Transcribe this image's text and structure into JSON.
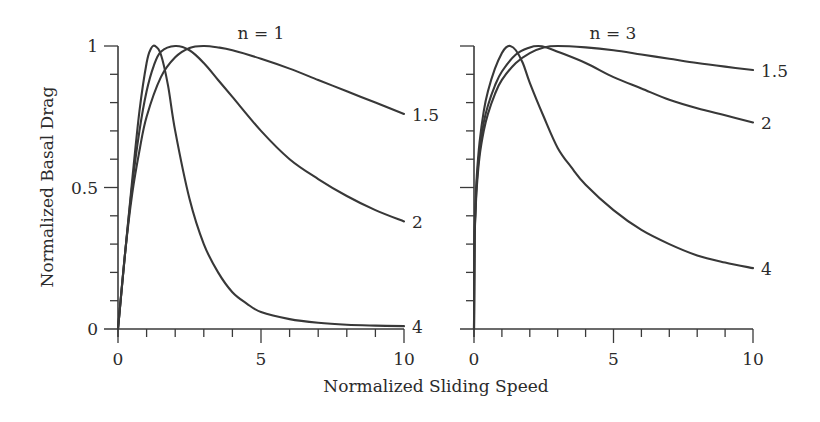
{
  "chart_data": {
    "type": "line",
    "xlabel": "Normalized Sliding Speed",
    "ylabel": "Normalized Basal Drag",
    "panels": [
      {
        "title": "n = 1",
        "xlim": [
          0,
          10
        ],
        "ylim": [
          0,
          1
        ],
        "x_tick_labels": [
          "0",
          "5",
          "10"
        ],
        "x_major_ticks": [
          0,
          5,
          10
        ],
        "x_minor_ticks": [
          1,
          2,
          3,
          4,
          6,
          7,
          8,
          9
        ],
        "y_tick_labels": [
          "0",
          "0.5",
          "1"
        ],
        "y_major_ticks": [
          0,
          0.5,
          1
        ],
        "y_minor_ticks": [
          0.1,
          0.2,
          0.3,
          0.4,
          0.6,
          0.7,
          0.8,
          0.9
        ],
        "show_y_tick_labels": true,
        "series": [
          {
            "name": "1.5",
            "x": [
              0,
              0.25,
              0.5,
              0.75,
              1,
              1.5,
              2,
              2.5,
              3,
              3.5,
              4,
              5,
              6,
              7,
              8,
              9,
              10
            ],
            "y": [
              0,
              0.27,
              0.48,
              0.63,
              0.75,
              0.89,
              0.96,
              0.993,
              1.0,
              0.995,
              0.985,
              0.955,
              0.92,
              0.88,
              0.84,
              0.8,
              0.76
            ]
          },
          {
            "name": "2",
            "x": [
              0,
              0.25,
              0.5,
              0.75,
              1,
              1.25,
              1.5,
              2,
              2.5,
              3,
              3.5,
              4,
              5,
              6,
              7,
              8,
              9,
              10
            ],
            "y": [
              0,
              0.27,
              0.51,
              0.7,
              0.84,
              0.93,
              0.98,
              1.0,
              0.985,
              0.94,
              0.88,
              0.82,
              0.7,
              0.6,
              0.53,
              0.47,
              0.42,
              0.38
            ]
          },
          {
            "name": "4",
            "x": [
              0,
              0.25,
              0.5,
              0.75,
              1,
              1.15,
              1.3,
              1.5,
              1.75,
              2,
              2.5,
              3,
              3.5,
              4,
              4.5,
              5,
              6,
              7,
              8,
              9,
              10
            ],
            "y": [
              0,
              0.27,
              0.53,
              0.77,
              0.94,
              0.99,
              1.0,
              0.97,
              0.86,
              0.7,
              0.46,
              0.3,
              0.2,
              0.13,
              0.09,
              0.06,
              0.035,
              0.022,
              0.015,
              0.012,
              0.01
            ]
          }
        ]
      },
      {
        "title": "n = 3",
        "xlim": [
          0,
          10
        ],
        "ylim": [
          0,
          1
        ],
        "x_tick_labels": [
          "0",
          "5",
          "10"
        ],
        "x_major_ticks": [
          0,
          5,
          10
        ],
        "x_minor_ticks": [
          1,
          2,
          3,
          4,
          6,
          7,
          8,
          9
        ],
        "y_tick_labels": [],
        "y_major_ticks": [
          0,
          0.5,
          1
        ],
        "y_minor_ticks": [
          0.1,
          0.2,
          0.3,
          0.4,
          0.6,
          0.7,
          0.8,
          0.9
        ],
        "show_y_tick_labels": false,
        "series": [
          {
            "name": "1.5",
            "x": [
              0,
              0.02,
              0.05,
              0.1,
              0.2,
              0.35,
              0.5,
              0.75,
              1,
              1.5,
              2,
              2.5,
              3,
              4,
              5,
              6,
              7,
              8,
              9,
              10
            ],
            "y": [
              0,
              0.3,
              0.4,
              0.5,
              0.61,
              0.7,
              0.76,
              0.83,
              0.88,
              0.94,
              0.975,
              0.995,
              1.0,
              0.995,
              0.985,
              0.97,
              0.955,
              0.94,
              0.927,
              0.915
            ]
          },
          {
            "name": "2",
            "x": [
              0,
              0.02,
              0.05,
              0.1,
              0.2,
              0.35,
              0.5,
              0.75,
              1,
              1.5,
              2,
              2.3,
              2.6,
              3,
              4,
              5,
              6,
              7,
              8,
              9,
              10
            ],
            "y": [
              0,
              0.31,
              0.41,
              0.52,
              0.63,
              0.73,
              0.79,
              0.86,
              0.91,
              0.97,
              0.995,
              1.0,
              0.995,
              0.98,
              0.94,
              0.89,
              0.85,
              0.81,
              0.78,
              0.755,
              0.73
            ]
          },
          {
            "name": "4",
            "x": [
              0,
              0.02,
              0.05,
              0.1,
              0.2,
              0.35,
              0.5,
              0.75,
              1,
              1.15,
              1.3,
              1.5,
              1.75,
              2,
              2.5,
              3,
              3.5,
              4,
              5,
              6,
              7,
              8,
              9,
              10
            ],
            "y": [
              0,
              0.32,
              0.43,
              0.54,
              0.66,
              0.77,
              0.84,
              0.92,
              0.975,
              0.995,
              1.0,
              0.985,
              0.94,
              0.87,
              0.75,
              0.64,
              0.57,
              0.51,
              0.42,
              0.35,
              0.3,
              0.26,
              0.235,
              0.215
            ]
          }
        ]
      }
    ]
  }
}
